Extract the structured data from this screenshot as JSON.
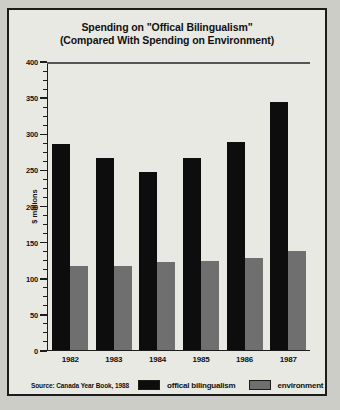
{
  "chart_data": {
    "type": "bar",
    "title": "Spending on \"Offical Bilingualism\" (Compared With Spending on Environment)",
    "title_lines": [
      "Spending on \"Offical Bilingualism\"",
      "(Compared With Spending on Environment)"
    ],
    "categories": [
      "1982",
      "1983",
      "1984",
      "1985",
      "1986",
      "1987"
    ],
    "series": [
      {
        "name": "offical bilingualism",
        "color": "#0d0d0d",
        "values": [
          284,
          265,
          246,
          265,
          287,
          343
        ]
      },
      {
        "name": "environment",
        "color": "#6f6f6f",
        "values": [
          116,
          116,
          121,
          122,
          127,
          137
        ]
      }
    ],
    "xlabel": "",
    "ylabel": "$ millions",
    "ylim": [
      0,
      400
    ],
    "ytick_step": 50,
    "yticks": [
      0,
      50,
      100,
      150,
      200,
      250,
      300,
      350,
      400
    ],
    "minor_tick_step": 12.5,
    "grid": false,
    "legend_position": "bottom",
    "source": "Source: Canada Year Book, 1988"
  },
  "colors": {
    "page_background": "#cdcdc8",
    "panel_background": "#e9e9e4",
    "border": "#1c1c1c",
    "series_a": "#0d0d0d",
    "series_b": "#6f6f6f"
  }
}
